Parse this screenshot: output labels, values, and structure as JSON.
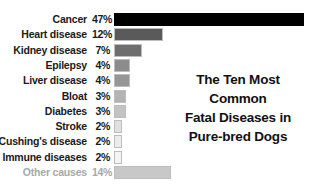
{
  "chart_data": {
    "type": "bar",
    "orientation": "horizontal",
    "title": "The Ten Most Common Fatal Diseases in Pure-bred Dogs",
    "title_lines": [
      "The Ten Most Common",
      "Fatal Diseases in",
      "Pure-bred Dogs"
    ],
    "xlabel": "",
    "ylabel": "",
    "grid": false,
    "legend": null,
    "categories": [
      "Cancer",
      "Heart disease",
      "Kidney disease",
      "Epilepsy",
      "Liver disease",
      "Bloat",
      "Diabetes",
      "Stroke",
      "Cushing's disease",
      "Immune diseases",
      "Other causes"
    ],
    "values": [
      47,
      12,
      7,
      4,
      4,
      3,
      3,
      2,
      2,
      2,
      14
    ],
    "value_labels": [
      "47%",
      "12%",
      "7%",
      "4%",
      "4%",
      "3%",
      "3%",
      "2%",
      "2%",
      "2%",
      "14%"
    ],
    "unit": "%",
    "bar_colors": [
      "#000000",
      "#5a5a5a",
      "#6e6e6e",
      "#8c8c8c",
      "#969696",
      "#b4b4b4",
      "#c3c3c3",
      "#e0e0e0",
      "#ececec",
      "#f4f4f4",
      "#c8c8c8"
    ],
    "xlim": [
      0,
      47
    ]
  },
  "rows": [
    {
      "label": "Cancer",
      "pct": "47%",
      "value": 47,
      "color": "#000000"
    },
    {
      "label": "Heart disease",
      "pct": "12%",
      "value": 12,
      "color": "#5a5a5a"
    },
    {
      "label": "Kidney disease",
      "pct": "7%",
      "value": 7,
      "color": "#6e6e6e"
    },
    {
      "label": "Epilepsy",
      "pct": "4%",
      "value": 4,
      "color": "#8c8c8c"
    },
    {
      "label": "Liver disease",
      "pct": "4%",
      "value": 4,
      "color": "#969696"
    },
    {
      "label": "Bloat",
      "pct": "3%",
      "value": 3,
      "color": "#b4b4b4"
    },
    {
      "label": "Diabetes",
      "pct": "3%",
      "value": 3,
      "color": "#c3c3c3"
    },
    {
      "label": "Stroke",
      "pct": "2%",
      "value": 2,
      "color": "#e0e0e0"
    },
    {
      "label": "Cushing's disease",
      "pct": "2%",
      "value": 2,
      "color": "#ececec"
    },
    {
      "label": "Immune diseases",
      "pct": "2%",
      "value": 2,
      "color": "#f4f4f4"
    },
    {
      "label": "Other causes",
      "pct": "14%",
      "value": 14,
      "color": "#c8c8c8"
    }
  ],
  "title": {
    "line1": "The Ten Most Common",
    "line2": "Fatal Diseases in",
    "line3": "Pure-bred Dogs"
  }
}
